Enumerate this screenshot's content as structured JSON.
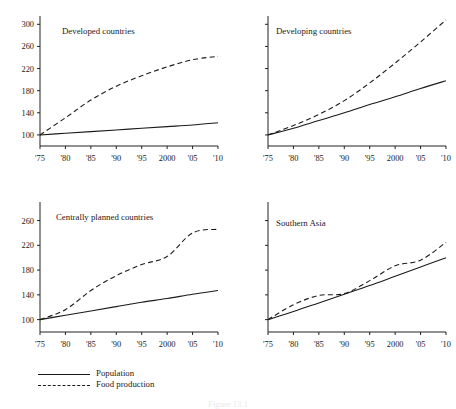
{
  "figure": {
    "caption": "Figure 13.1",
    "legend": {
      "position": "bottom-left",
      "items": [
        {
          "label": "Population",
          "style": "solid",
          "key_name": "legend-key-population"
        },
        {
          "label": "Food production",
          "style": "dashed",
          "key_name": "legend-key-food-production"
        }
      ]
    }
  },
  "chart_data": [
    {
      "type": "line",
      "title": "Developed countries",
      "xlabel": "",
      "ylabel": "",
      "x": [
        1975,
        1980,
        1985,
        1990,
        1995,
        2000,
        2005,
        2010
      ],
      "xtick_labels": [
        "'75",
        "'80",
        "'85",
        "'90",
        "'95",
        "2000",
        "'05",
        "'10"
      ],
      "ytick_labels": [
        "100",
        "140",
        "180",
        "220",
        "260",
        "300"
      ],
      "yticks": [
        100,
        140,
        180,
        220,
        260,
        300
      ],
      "ylim": [
        80,
        315
      ],
      "xlim": [
        1975,
        2010
      ],
      "grid": false,
      "legend": "none",
      "series": [
        {
          "name": "Population",
          "style": "solid",
          "values": [
            100,
            103,
            106,
            109,
            112,
            115,
            118,
            122
          ]
        },
        {
          "name": "Food production",
          "style": "dashed",
          "values": [
            100,
            131,
            163,
            188,
            207,
            223,
            236,
            242
          ]
        }
      ]
    },
    {
      "type": "line",
      "title": "Developing countries",
      "xlabel": "",
      "ylabel": "",
      "x": [
        1975,
        1980,
        1985,
        1990,
        1995,
        2000,
        2005,
        2010
      ],
      "xtick_labels": [
        "'75",
        "'80",
        "'85",
        "'90",
        "'95",
        "2000",
        "'05",
        "'10"
      ],
      "ytick_labels": [],
      "yticks": [
        100,
        140,
        180,
        220,
        260,
        300
      ],
      "ylim": [
        80,
        315
      ],
      "xlim": [
        1975,
        2010
      ],
      "grid": false,
      "legend": "none",
      "series": [
        {
          "name": "Population",
          "style": "solid",
          "values": [
            100,
            112,
            126,
            140,
            155,
            169,
            184,
            198
          ]
        },
        {
          "name": "Food production",
          "style": "dashed",
          "values": [
            100,
            117,
            137,
            162,
            194,
            230,
            268,
            308
          ]
        }
      ]
    },
    {
      "type": "line",
      "title": "Centrally planned countries",
      "xlabel": "",
      "ylabel": "",
      "x": [
        1975,
        1980,
        1985,
        1990,
        1995,
        2000,
        2005,
        2010
      ],
      "xtick_labels": [
        "'75",
        "'80",
        "'85",
        "'90",
        "'95",
        "2000",
        "'05",
        "'10"
      ],
      "ytick_labels": [
        "100",
        "140",
        "180",
        "220",
        "260"
      ],
      "yticks": [
        100,
        140,
        180,
        220,
        260
      ],
      "ylim": [
        80,
        290
      ],
      "xlim": [
        1975,
        2010
      ],
      "grid": false,
      "legend": "none",
      "series": [
        {
          "name": "Population",
          "style": "solid",
          "values": [
            100,
            107,
            114,
            121,
            128,
            134,
            141,
            147
          ]
        },
        {
          "name": "Food production",
          "style": "dashed",
          "values": [
            100,
            116,
            147,
            171,
            189,
            202,
            240,
            246
          ]
        }
      ]
    },
    {
      "type": "line",
      "title": "Southern Asia",
      "xlabel": "",
      "ylabel": "",
      "x": [
        1975,
        1980,
        1985,
        1990,
        1995,
        2000,
        2005,
        2010
      ],
      "xtick_labels": [
        "'75",
        "'80",
        "'85",
        "'90",
        "'95",
        "2000",
        "'05",
        "'10"
      ],
      "ytick_labels": [],
      "yticks": [
        100,
        140,
        180,
        220,
        260
      ],
      "ylim": [
        80,
        290
      ],
      "xlim": [
        1975,
        2010
      ],
      "grid": false,
      "legend": "none",
      "series": [
        {
          "name": "Population",
          "style": "solid",
          "values": [
            100,
            113,
            127,
            141,
            155,
            170,
            185,
            200
          ]
        },
        {
          "name": "Food production",
          "style": "dashed",
          "values": [
            100,
            124,
            139,
            142,
            163,
            187,
            196,
            225
          ]
        }
      ]
    }
  ]
}
